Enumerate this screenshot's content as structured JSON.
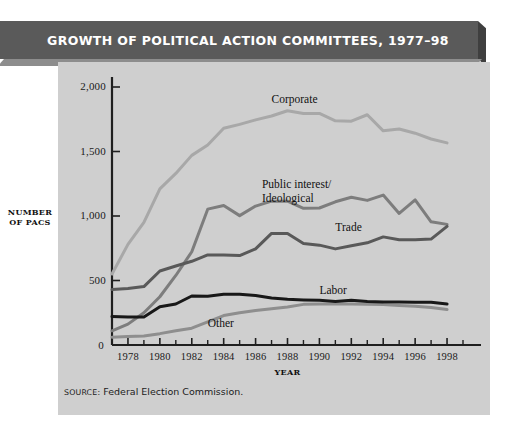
{
  "banner": {
    "title": "GROWTH OF POLITICAL ACTION COMMITTEES, 1977–98",
    "bg_color": "#5a5a5a",
    "text_color": "#ffffff"
  },
  "panel": {
    "bg_color": "#cfcfcf"
  },
  "source": {
    "label": "SOURCE:",
    "text": "Federal Election Commission."
  },
  "chart_data": {
    "type": "line",
    "title": "GROWTH OF POLITICAL ACTION COMMITTEES, 1977–98",
    "xlabel": "YEAR",
    "ylabel": "NUMBER OF PACS",
    "ylabel_line1": "NUMBER",
    "ylabel_line2": "OF PACS",
    "xlim": [
      1977,
      1999
    ],
    "ylim": [
      0,
      2000
    ],
    "ytick_labels": [
      "2,000",
      "1,500",
      "1,000",
      "500",
      "0"
    ],
    "ytick_values": [
      2000,
      1500,
      1000,
      500,
      0
    ],
    "xtick_labels": [
      "1978",
      "1980",
      "1982",
      "1984",
      "1986",
      "1988",
      "1990",
      "1992",
      "1994",
      "1996",
      "1998"
    ],
    "xtick_values": [
      1978,
      1980,
      1982,
      1984,
      1986,
      1988,
      1990,
      1992,
      1994,
      1996,
      1998
    ],
    "minor_tick_values": [
      1979,
      1981,
      1983,
      1985,
      1987,
      1989,
      1991,
      1993,
      1995,
      1997,
      1999
    ],
    "grid": false,
    "legend": "inline-labels",
    "x": [
      1977,
      1978,
      1979,
      1980,
      1981,
      1982,
      1983,
      1984,
      1985,
      1986,
      1987,
      1988,
      1989,
      1990,
      1991,
      1992,
      1993,
      1994,
      1995,
      1996,
      1997,
      1998
    ],
    "series": [
      {
        "name": "Corporate",
        "color": "#a8a8a8",
        "label_x": 1987.0,
        "label_y": 1950,
        "values": [
          550,
          780,
          950,
          1210,
          1330,
          1470,
          1550,
          1680,
          1710,
          1745,
          1775,
          1816,
          1795,
          1795,
          1738,
          1735,
          1785,
          1660,
          1674,
          1642,
          1597,
          1567
        ]
      },
      {
        "name": "Public interest/ Ideological",
        "color": "#7d7d7d",
        "label_x": 1986.4,
        "label_y": 1295,
        "label_line1": "Public interest/",
        "label_line2": "Ideological",
        "values": [
          110,
          162,
          250,
          374,
          539,
          723,
          1053,
          1082,
          1003,
          1077,
          1115,
          1115,
          1060,
          1062,
          1110,
          1145,
          1121,
          1162,
          1020,
          1125,
          955,
          935
        ]
      },
      {
        "name": "Trade",
        "color": "#595959",
        "label_x": 1991.0,
        "label_y": 960,
        "values": [
          430,
          438,
          453,
          574,
          612,
          649,
          698,
          698,
          693,
          745,
          865,
          865,
          786,
          774,
          745,
          770,
          792,
          838,
          816,
          815,
          821,
          920
        ]
      },
      {
        "name": "Labor",
        "color": "#181818",
        "label_x": 1990.0,
        "label_y": 470,
        "values": [
          220,
          217,
          217,
          297,
          318,
          380,
          378,
          394,
          394,
          384,
          364,
          354,
          349,
          346,
          338,
          347,
          337,
          333,
          334,
          332,
          332,
          318
        ]
      },
      {
        "name": "Other",
        "color": "#8e8e8e",
        "label_x": 1983.0,
        "label_y": 220,
        "values": [
          60,
          65,
          70,
          88,
          110,
          130,
          180,
          228,
          250,
          268,
          281,
          295,
          315,
          318,
          318,
          318,
          315,
          313,
          306,
          300,
          290,
          275
        ]
      }
    ]
  }
}
